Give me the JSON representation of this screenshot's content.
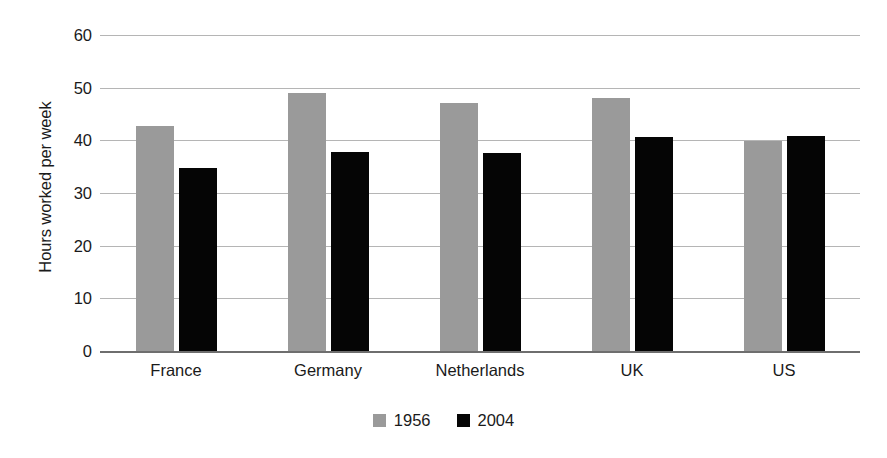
{
  "chart_data": {
    "type": "bar",
    "title": "",
    "subtitle": "",
    "xlabel": "",
    "ylabel": "Hours worked per week",
    "categories": [
      "France",
      "Germany",
      "Netherlands",
      "UK",
      "US"
    ],
    "series": [
      {
        "name": "1956",
        "color": "#9a9a9a",
        "values": [
          42.8,
          49.0,
          47.0,
          48.0,
          39.8
        ]
      },
      {
        "name": "2004",
        "color": "#050505",
        "values": [
          34.7,
          37.7,
          37.6,
          40.7,
          40.8
        ]
      }
    ],
    "ylim": [
      0,
      60
    ],
    "y_ticks": [
      0,
      10,
      20,
      30,
      40,
      50,
      60
    ],
    "y_tick_labels": [
      "0",
      "10",
      "20",
      "30",
      "40",
      "50",
      "60"
    ],
    "grid": true,
    "grid_axis": "y",
    "legend_position": "bottom-center",
    "bar_group_layout": "grouped",
    "background_color": "#ffffff",
    "gridline_color": "#b5b5b5",
    "axis_color": "#6e6e6e"
  },
  "axes": {
    "y_title": "Hours worked per week"
  },
  "legend": {
    "entries": [
      {
        "label": "1956",
        "swatch": "gray-square-swatch"
      },
      {
        "label": "2004",
        "swatch": "black-square-swatch"
      }
    ]
  }
}
